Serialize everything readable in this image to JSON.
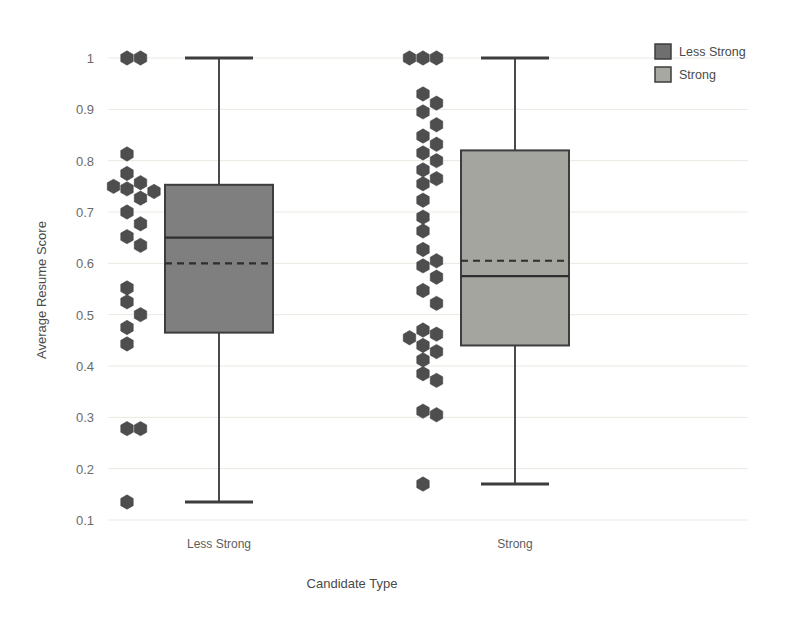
{
  "chart_data": {
    "type": "box",
    "title": "",
    "xlabel": "Candidate Type",
    "ylabel": "Average Resume Score",
    "categories": [
      "Less Strong",
      "Strong"
    ],
    "ylim": [
      0.1,
      1.03
    ],
    "yticks": [
      0.1,
      0.2,
      0.3,
      0.4,
      0.5,
      0.6,
      0.7,
      0.8,
      0.9,
      1
    ],
    "ytick_labels": [
      "0.1",
      "0.2",
      "0.3",
      "0.4",
      "0.5",
      "0.6",
      "0.7",
      "0.8",
      "0.9",
      "1"
    ],
    "grid": true,
    "legend_position": "top-right",
    "series": [
      {
        "name": "Less Strong",
        "color": "#7f7f7f",
        "q1": 0.465,
        "median": 0.65,
        "q3": 0.753,
        "mean": 0.6,
        "whisker_low": 0.135,
        "whisker_high": 1.0,
        "points": [
          1.0,
          1.0,
          0.813,
          0.775,
          0.757,
          0.75,
          0.745,
          0.74,
          0.727,
          0.7,
          0.677,
          0.652,
          0.635,
          0.552,
          0.525,
          0.5,
          0.475,
          0.443,
          0.278,
          0.278,
          0.135
        ]
      },
      {
        "name": "Strong",
        "color": "#a5a5a0",
        "q1": 0.44,
        "median": 0.575,
        "q3": 0.82,
        "mean": 0.605,
        "whisker_low": 0.17,
        "whisker_high": 1.0,
        "points": [
          1.0,
          1.0,
          1.0,
          0.93,
          0.912,
          0.895,
          0.87,
          0.848,
          0.832,
          0.815,
          0.8,
          0.782,
          0.765,
          0.755,
          0.723,
          0.69,
          0.663,
          0.627,
          0.605,
          0.595,
          0.573,
          0.547,
          0.522,
          0.47,
          0.462,
          0.455,
          0.44,
          0.428,
          0.412,
          0.385,
          0.372,
          0.312,
          0.305,
          0.17
        ]
      }
    ],
    "legend": [
      {
        "label": "Less Strong",
        "color": "#6f6f6f"
      },
      {
        "label": "Strong",
        "color": "#a8a8a3"
      }
    ]
  },
  "colors": {
    "background": "#ffffff",
    "grid": "#e9e9e2",
    "outline": "#3d3d3d",
    "dot": "#4e4e4e",
    "text": "#4a4a4a"
  }
}
